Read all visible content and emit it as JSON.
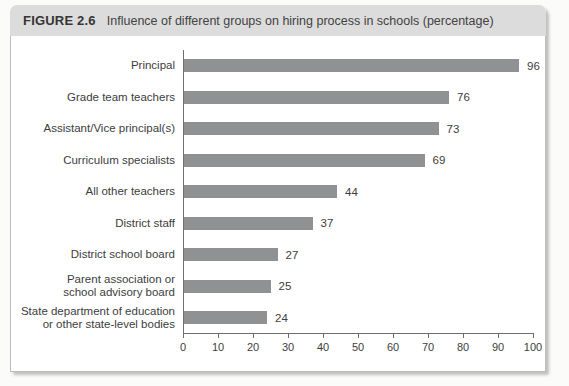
{
  "figure": {
    "label": "FIGURE 2.6",
    "title": "Influence of different groups on hiring process in schools (percentage)"
  },
  "chart_data": {
    "type": "bar",
    "orientation": "horizontal",
    "title": "Influence of different groups on hiring process in schools (percentage)",
    "categories": [
      "Principal",
      "Grade team teachers",
      "Assistant/Vice principal(s)",
      "Curriculum specialists",
      "All other teachers",
      "District staff",
      "District school board",
      "Parent association or\nschool advisory board",
      "State department of education\nor other state-level bodies"
    ],
    "values": [
      96,
      76,
      73,
      69,
      44,
      37,
      27,
      25,
      24
    ],
    "value_labels_shown": true,
    "xlabel": "",
    "ylabel": "",
    "xlim": [
      0,
      100
    ],
    "xticks": [
      0,
      10,
      20,
      30,
      40,
      50,
      60,
      70,
      80,
      90,
      100
    ],
    "grid": false,
    "legend": "none"
  },
  "colors": {
    "bar": "#8f9193",
    "axis": "#6f6f6f",
    "text": "#3d3d3d",
    "header_bg": "#dcdcdc",
    "card_border": "#bdbdbd"
  }
}
